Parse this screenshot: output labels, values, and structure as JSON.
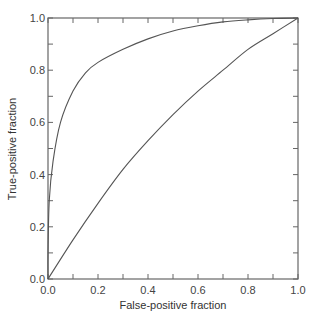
{
  "chart_data": {
    "type": "line",
    "title": "",
    "xlabel": "False-positive fraction",
    "ylabel": "True-positive fraction",
    "xlim": [
      0,
      1
    ],
    "ylim": [
      0,
      1
    ],
    "grid": false,
    "legend": null,
    "x_ticks": [
      "0.0",
      "0.2",
      "0.4",
      "0.6",
      "0.8",
      "1.0"
    ],
    "y_ticks": [
      "0.0",
      "0.2",
      "0.4",
      "0.6",
      "0.8",
      "1.0"
    ],
    "minor_tick_step": 0.1,
    "series": [
      {
        "name": "upper ROC curve",
        "color": "#555555",
        "points": [
          [
            0,
            0
          ],
          [
            0,
            0.1
          ],
          [
            0.005,
            0.3
          ],
          [
            0.02,
            0.45
          ],
          [
            0.05,
            0.6
          ],
          [
            0.1,
            0.72
          ],
          [
            0.15,
            0.79
          ],
          [
            0.2,
            0.83
          ],
          [
            0.3,
            0.88
          ],
          [
            0.4,
            0.92
          ],
          [
            0.5,
            0.95
          ],
          [
            0.6,
            0.97
          ],
          [
            0.7,
            0.985
          ],
          [
            0.8,
            0.993
          ],
          [
            0.9,
            0.998
          ],
          [
            1,
            1
          ]
        ]
      },
      {
        "name": "lower ROC curve",
        "color": "#555555",
        "points": [
          [
            0,
            0
          ],
          [
            0.1,
            0.15
          ],
          [
            0.2,
            0.29
          ],
          [
            0.3,
            0.42
          ],
          [
            0.4,
            0.53
          ],
          [
            0.5,
            0.63
          ],
          [
            0.6,
            0.72
          ],
          [
            0.7,
            0.8
          ],
          [
            0.8,
            0.88
          ],
          [
            0.9,
            0.94
          ],
          [
            1,
            1
          ]
        ]
      }
    ]
  },
  "axes": {
    "x_label": "False-positive fraction",
    "y_label": "True-positive fraction",
    "axis_color": "#666666"
  }
}
